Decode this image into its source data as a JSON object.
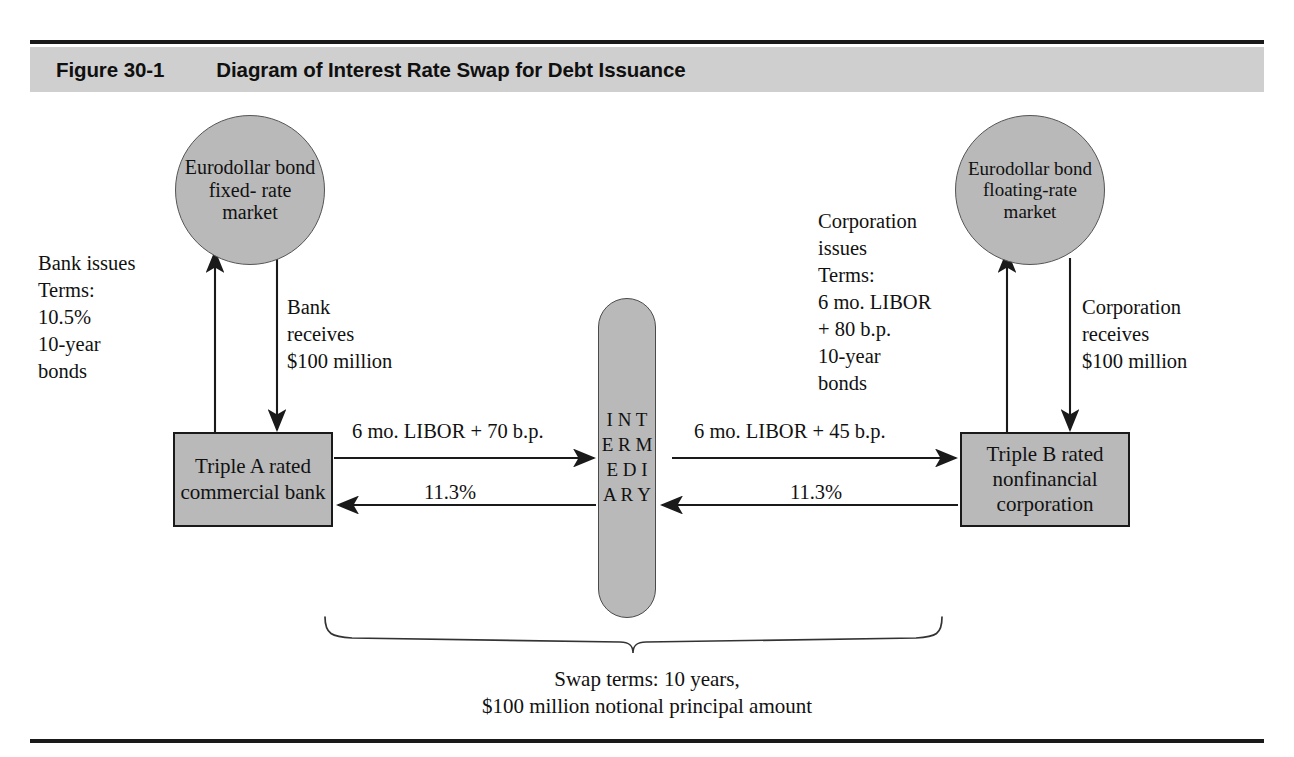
{
  "figure": {
    "number": "Figure 30-1",
    "title": "Diagram of Interest Rate Swap for Debt Issuance"
  },
  "markets": {
    "left": "Eurodollar\nbond fixed-\nrate market",
    "right": "Eurodollar\nbond\nfloating-rate\nmarket"
  },
  "parties": {
    "left": "Triple A rated\ncommercial\nbank",
    "right": "Triple B rated\nnonfinancial\ncorporation"
  },
  "intermediary": {
    "label": "INTERMEDIARY",
    "letters": "I\nN\nT\nE\nR\nM\nE\nD\nI\nA\nR\nY"
  },
  "annotations": {
    "bank_issues": "Bank issues\nTerms:\n10.5%\n10-year\n bonds",
    "bank_receives": "Bank\nreceives\n$100 million",
    "corporation_issues": "Corporation\nissues\nTerms:\n6 mo. LIBOR\n+ 80 b.p.\n10-year\nbonds",
    "corporation_receives": "Corporation\nreceives\n$100 million"
  },
  "flows": {
    "bank_to_intermediary_floating": "6 mo. LIBOR + 70 b.p.",
    "intermediary_to_bank_fixed": "11.3%",
    "intermediary_to_corporation_floating": "6 mo. LIBOR + 45 b.p.",
    "corporation_to_intermediary_fixed": "11.3%"
  },
  "swap_terms": "Swap terms: 10 years,\n$100 million notional principal amount",
  "colors": {
    "header_band": "#cfcfcf",
    "shape_fill": "#b9b9b9",
    "stroke": "#1a1a1a",
    "text": "#111111"
  }
}
